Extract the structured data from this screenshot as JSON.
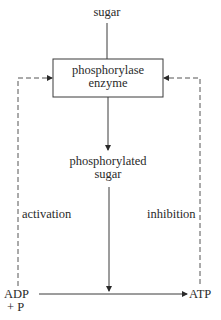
{
  "diagram": {
    "type": "flow",
    "nodes": {
      "sugar": "sugar",
      "enzyme_line1": "phosphorylase",
      "enzyme_line2": "enzyme",
      "product_line1": "phosphorylated",
      "product_line2": "sugar",
      "adp_line1": "ADP",
      "adp_line2": "+ P",
      "atp": "ATP"
    },
    "edge_labels": {
      "activation": "activation",
      "inhibition": "inhibition"
    },
    "edges": [
      {
        "from": "sugar",
        "to": "phosphorylase enzyme",
        "style": "solid"
      },
      {
        "from": "phosphorylase enzyme",
        "to": "phosphorylated sugar",
        "style": "solid",
        "arrow": true
      },
      {
        "from": "phosphorylated sugar",
        "to": "ADP→ATP reaction",
        "style": "solid",
        "arrow": true
      },
      {
        "from": "ADP + P",
        "to": "ATP",
        "style": "solid",
        "arrow": true
      },
      {
        "from": "ADP + P",
        "to": "phosphorylase enzyme",
        "style": "dashed",
        "label": "activation",
        "arrow": true
      },
      {
        "from": "ATP",
        "to": "phosphorylase enzyme",
        "style": "dashed",
        "label": "inhibition",
        "arrow": true
      }
    ],
    "colors": {
      "line": "#3a3a3a",
      "text": "#2a2a2a",
      "background": "#ffffff"
    }
  }
}
